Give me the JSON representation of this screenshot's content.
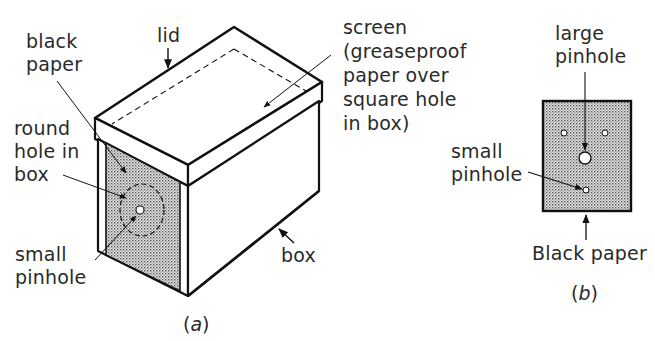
{
  "figure_a": {
    "caption_letter": "a",
    "labels": {
      "black_paper": "black\npaper",
      "lid": "lid",
      "screen": "screen\n(greaseproof\npaper over\nsquare hole\nin box)",
      "round_hole": "round\nhole in\nbox",
      "small_pinhole": "small\npinhole",
      "box": "box"
    }
  },
  "figure_b": {
    "caption_letter": "b",
    "labels": {
      "large_pinhole": "large\npinhole",
      "small_pinhole": "small\npinhole",
      "black_paper": "Black paper"
    }
  },
  "colors": {
    "ink": "#1a1a1a",
    "shade": "#c8c8c8",
    "background": "#ffffff"
  }
}
